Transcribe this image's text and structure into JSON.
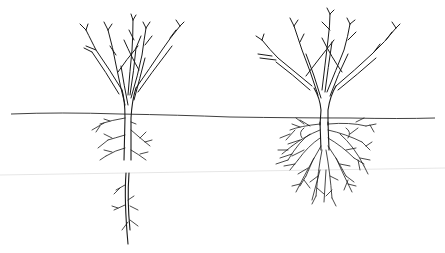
{
  "illustration": {
    "subject": "Two bare-root shrubs above a ground line",
    "left_plant": {
      "description": "shrub with main tap root cut, severed root segment shown below",
      "root_type": "tap-root-severed"
    },
    "right_plant": {
      "description": "shrub with dense fibrous root ball",
      "root_type": "fibrous"
    },
    "colors": {
      "background": "#ffffff",
      "ink": "#1a1a1a"
    }
  }
}
